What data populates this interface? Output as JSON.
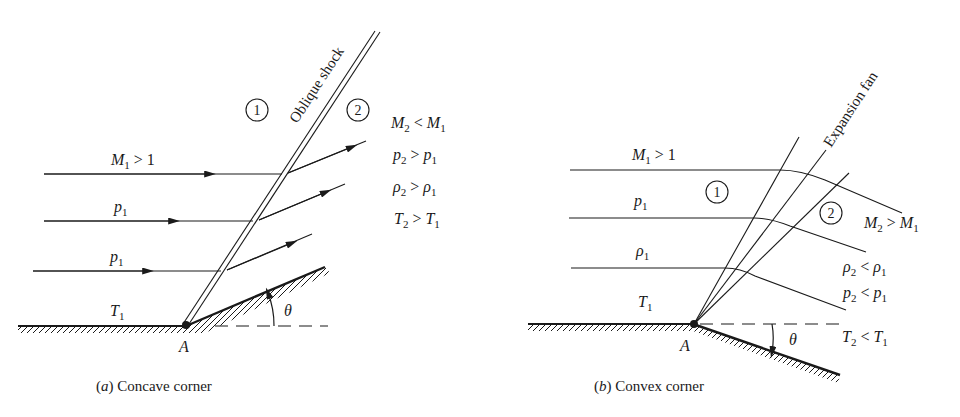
{
  "colors": {
    "ink": "#1a1a1a",
    "background": "#ffffff"
  },
  "panel_a": {
    "caption_letter": "a",
    "caption_text": "Concave corner",
    "shock_label": "Oblique shock",
    "region_1": "1",
    "region_2": "2",
    "corner_label": "A",
    "angle_label": "θ",
    "upstream": {
      "mach": {
        "sym": "M",
        "sub": "1",
        "rel": " > 1"
      },
      "pressure": {
        "sym": "p",
        "sub": "1"
      },
      "density": {
        "sym": "p",
        "sub": "1"
      },
      "temperature": {
        "sym": "T",
        "sub": "1"
      }
    },
    "downstream": [
      {
        "lhs": "M",
        "lhs_sub": "2",
        "op": " < ",
        "rhs": "M",
        "rhs_sub": "1"
      },
      {
        "lhs": "p",
        "lhs_sub": "2",
        "op": " > ",
        "rhs": "p",
        "rhs_sub": "1"
      },
      {
        "lhs": "ρ",
        "lhs_sub": "2",
        "op": " > ",
        "rhs": "ρ",
        "rhs_sub": "1"
      },
      {
        "lhs": "T",
        "lhs_sub": "2",
        "op": " > ",
        "rhs": "T",
        "rhs_sub": "1"
      }
    ]
  },
  "panel_b": {
    "caption_letter": "b",
    "caption_text": "Convex corner",
    "fan_label": "Expansion fan",
    "region_1": "1",
    "region_2": "2",
    "corner_label": "A",
    "angle_label": "θ",
    "upstream": {
      "mach": {
        "sym": "M",
        "sub": "1",
        "rel": " > 1"
      },
      "pressure": {
        "sym": "p",
        "sub": "1"
      },
      "density": {
        "sym": "ρ",
        "sub": "1"
      },
      "temperature": {
        "sym": "T",
        "sub": "1"
      }
    },
    "downstream": [
      {
        "lhs": "M",
        "lhs_sub": "2",
        "op": " > ",
        "rhs": "M",
        "rhs_sub": "1"
      },
      {
        "lhs": "ρ",
        "lhs_sub": "2",
        "op": " < ",
        "rhs": "ρ",
        "rhs_sub": "1"
      },
      {
        "lhs": "p",
        "lhs_sub": "2",
        "op": " < ",
        "rhs": "p",
        "rhs_sub": "1"
      },
      {
        "lhs": "T",
        "lhs_sub": "2",
        "op": " < ",
        "rhs": "T",
        "rhs_sub": "1"
      }
    ]
  }
}
